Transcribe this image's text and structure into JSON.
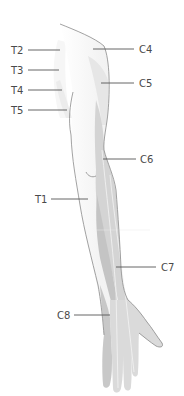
{
  "diagram": {
    "colors": {
      "background": "#ffffff",
      "skin_light": "#f2f2f2",
      "skin_mid": "#e4e4e4",
      "dermatome_dark": "#c8c8c8",
      "dermatome_mid": "#d6d6d6",
      "outline": "#8a8a8a",
      "label_text": "#4a4a4a",
      "leader_line": "#555555"
    },
    "labels": [
      {
        "id": "T2",
        "text": "T2",
        "side": "left"
      },
      {
        "id": "T3",
        "text": "T3",
        "side": "left"
      },
      {
        "id": "T4",
        "text": "T4",
        "side": "left"
      },
      {
        "id": "T5",
        "text": "T5",
        "side": "left"
      },
      {
        "id": "C4",
        "text": "C4",
        "side": "right"
      },
      {
        "id": "C5",
        "text": "C5",
        "side": "right"
      },
      {
        "id": "C6",
        "text": "C6",
        "side": "right"
      },
      {
        "id": "T1",
        "text": "T1",
        "side": "left"
      },
      {
        "id": "C7",
        "text": "C7",
        "side": "right"
      },
      {
        "id": "C8",
        "text": "C8",
        "side": "left"
      }
    ]
  }
}
